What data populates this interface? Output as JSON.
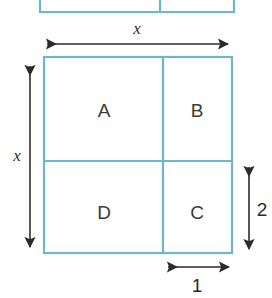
{
  "figure": {
    "colors": {
      "rect_stroke": "#6BB8CC",
      "arrow": "#2b2b2b",
      "label_text": "#3a3a3a",
      "background": "#ffffff"
    },
    "top_partial_rect": {
      "description": "partially visible rectangle cropped at the top edge of the image",
      "left": 40,
      "right": 234,
      "bottom": 12,
      "divider_x": 160
    },
    "main_square": {
      "left": 44,
      "top": 57,
      "right": 232,
      "bottom": 253,
      "vertical_divider_x": 163,
      "horizontal_divider_y": 161
    },
    "regions": [
      {
        "id": "region-a",
        "label": "A",
        "x": 104,
        "y": 110
      },
      {
        "id": "region-b",
        "label": "B",
        "x": 197,
        "y": 110
      },
      {
        "id": "region-d",
        "label": "D",
        "x": 104,
        "y": 212
      },
      {
        "id": "region-c",
        "label": "C",
        "x": 197,
        "y": 212
      }
    ],
    "dimensions": [
      {
        "id": "dim-top-width",
        "label": "x",
        "orientation": "horizontal",
        "label_x": 137,
        "label_y": 28,
        "from": 43,
        "to": 231,
        "axis": 44
      },
      {
        "id": "dim-left-height",
        "label": "x",
        "orientation": "vertical",
        "label_x": 17,
        "label_y": 155,
        "from": 62,
        "to": 250,
        "axis": 30
      },
      {
        "id": "dim-right-height",
        "label": "2",
        "orientation": "vertical",
        "label_x": 262,
        "label_y": 209,
        "from": 163,
        "to": 252,
        "axis": 249
      },
      {
        "id": "dim-bottom-width",
        "label": "1",
        "orientation": "horizontal",
        "label_x": 197,
        "label_y": 285,
        "from": 164,
        "to": 232,
        "axis": 267
      }
    ]
  }
}
